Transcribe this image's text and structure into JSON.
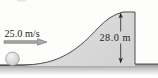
{
  "diagram": {
    "type": "physics-projectile-hill-diagram",
    "labels": {
      "velocity": "25.0 m/s",
      "height": "28.0 m"
    },
    "values": {
      "initial_speed": 25.0,
      "speed_unit": "m/s",
      "hill_height": 28.0,
      "height_unit": "m"
    },
    "colors": {
      "background": "#fdfdfc",
      "hill_fill": "#d9d9d9",
      "hill_fill_light": "#e6e6e6",
      "outline": "#3a3a3a",
      "velocity_arrow_fill": "#a8a8a8",
      "velocity_arrow_edge": "#5a5a5a",
      "dimension_arrow": "#222222",
      "ball_fill": "#dedede",
      "ball_edge": "#8a8a8a",
      "ground_shadow": "#8f8f8f",
      "text": "#1c1c1c"
    }
  }
}
